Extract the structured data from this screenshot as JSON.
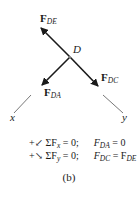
{
  "diagram": {
    "joint_label": "D",
    "forces": [
      {
        "id": "FDE",
        "symbol": "F",
        "subscript": "DE"
      },
      {
        "id": "FDA",
        "symbol": "F",
        "subscript": "DA"
      },
      {
        "id": "FDC",
        "symbol": "F",
        "subscript": "DC"
      }
    ],
    "axes": {
      "x_label": "x",
      "y_label": "y"
    },
    "equations": [
      {
        "direction_symbol": "+↙",
        "sum": "ΣF",
        "sum_sub": "x",
        "equals": "= 0;",
        "result_lhs": "F",
        "result_lhs_sub": "DA",
        "result_rhs": "= 0",
        "result_rhs_sub": ""
      },
      {
        "direction_symbol": "+↘",
        "sum": "ΣF",
        "sum_sub": "y",
        "equals": "= 0;",
        "result_lhs": "F",
        "result_lhs_sub": "DC",
        "result_rhs": "= F",
        "result_rhs_sub": "DE"
      }
    ],
    "caption": "(b)",
    "colors": {
      "ink": "#1a1a1a",
      "axis": "#555555",
      "background": "#ffffff"
    }
  }
}
